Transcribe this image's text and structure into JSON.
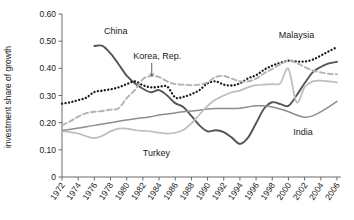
{
  "chart_data": {
    "type": "line",
    "title": "",
    "xlabel": "",
    "ylabel": "investment share of growth",
    "xlim": [
      1972,
      2006.5
    ],
    "ylim": [
      0,
      0.6
    ],
    "grid": false,
    "legend_position": "inline-annotations",
    "xticks": [
      "1972",
      "1974",
      "1976",
      "1978",
      "1980",
      "1982",
      "1984",
      "1986",
      "1988",
      "1990",
      "1992",
      "1994",
      "1996",
      "1998",
      "2000",
      "2002",
      "2004",
      "2006"
    ],
    "yticks": [
      "0",
      "0.10",
      "0.20",
      "0.30",
      "0.40",
      "0.50",
      "0.60"
    ],
    "series": [
      {
        "name": "China",
        "label": "China",
        "style": "solid",
        "color": "#555555",
        "width": 1.9,
        "label_x": 1977.2,
        "label_y": 0.525,
        "x": [
          1976,
          1977,
          1978,
          1979,
          1980,
          1981,
          1982,
          1983,
          1984,
          1985,
          1986,
          1987,
          1988,
          1989,
          1990,
          1991,
          1992,
          1993,
          1994,
          1995,
          1996,
          1997,
          1998,
          1999,
          2000,
          2001,
          2002,
          2003,
          2004,
          2005,
          2006
        ],
        "y": [
          0.482,
          0.483,
          0.455,
          0.415,
          0.373,
          0.345,
          0.325,
          0.312,
          0.32,
          0.3,
          0.272,
          0.258,
          0.225,
          0.19,
          0.168,
          0.172,
          0.165,
          0.145,
          0.122,
          0.145,
          0.198,
          0.252,
          0.275,
          0.268,
          0.262,
          0.3,
          0.345,
          0.385,
          0.405,
          0.418,
          0.424
        ]
      },
      {
        "name": "Malaysia",
        "label": "Malaysia",
        "style": "dotted",
        "color": "#1a1a1a",
        "width": 2.3,
        "label_x": 1998.8,
        "label_y": 0.512,
        "x": [
          1972,
          1973,
          1974,
          1975,
          1976,
          1977,
          1978,
          1979,
          1980,
          1981,
          1982,
          1983,
          1984,
          1985,
          1986,
          1987,
          1988,
          1989,
          1990,
          1991,
          1992,
          1993,
          1994,
          1995,
          1996,
          1997,
          1998,
          1999,
          2000,
          2001,
          2002,
          2003,
          2004,
          2005,
          2006
        ],
        "y": [
          0.27,
          0.275,
          0.283,
          0.292,
          0.313,
          0.318,
          0.323,
          0.33,
          0.342,
          0.352,
          0.338,
          0.33,
          0.332,
          0.333,
          0.293,
          0.295,
          0.305,
          0.32,
          0.345,
          0.352,
          0.34,
          0.337,
          0.345,
          0.363,
          0.375,
          0.395,
          0.41,
          0.42,
          0.428,
          0.425,
          0.425,
          0.432,
          0.447,
          0.463,
          0.478
        ]
      },
      {
        "name": "Korea, Rep.",
        "label": "Korea, Rep.",
        "style": "dashed",
        "color": "#b3b3b3",
        "width": 1.9,
        "label_x": 1980.8,
        "label_y": 0.435,
        "arrow_from_x": 1983.1,
        "arrow_from_y": 0.42,
        "arrow_to_y": 0.372,
        "x": [
          1972,
          1973,
          1974,
          1975,
          1976,
          1977,
          1978,
          1979,
          1980,
          1981,
          1982,
          1983,
          1984,
          1985,
          1986,
          1987,
          1988,
          1989,
          1990,
          1991,
          1992,
          1993,
          1994,
          1995,
          1996,
          1997,
          1998,
          1999,
          2000,
          2001,
          2002,
          2003,
          2004,
          2005,
          2006
        ],
        "y": [
          0.19,
          0.205,
          0.222,
          0.235,
          0.24,
          0.243,
          0.248,
          0.253,
          0.29,
          0.32,
          0.36,
          0.372,
          0.368,
          0.352,
          0.342,
          0.34,
          0.338,
          0.34,
          0.348,
          0.368,
          0.372,
          0.362,
          0.352,
          0.352,
          0.362,
          0.382,
          0.398,
          0.415,
          0.428,
          0.42,
          0.405,
          0.392,
          0.385,
          0.38,
          0.378
        ]
      },
      {
        "name": "India",
        "label": "India",
        "style": "solid",
        "color": "#8c8c8c",
        "width": 1.5,
        "label_x": 2000.6,
        "label_y": 0.155,
        "x": [
          1972,
          1973,
          1974,
          1975,
          1976,
          1977,
          1978,
          1979,
          1980,
          1981,
          1982,
          1983,
          1984,
          1985,
          1986,
          1987,
          1988,
          1989,
          1990,
          1991,
          1992,
          1993,
          1994,
          1995,
          1996,
          1997,
          1998,
          1999,
          2000,
          2001,
          2002,
          2003,
          2004,
          2005,
          2006
        ],
        "y": [
          0.172,
          0.175,
          0.18,
          0.185,
          0.19,
          0.195,
          0.2,
          0.205,
          0.21,
          0.214,
          0.218,
          0.222,
          0.228,
          0.232,
          0.236,
          0.24,
          0.243,
          0.246,
          0.25,
          0.252,
          0.252,
          0.252,
          0.253,
          0.258,
          0.262,
          0.262,
          0.258,
          0.25,
          0.24,
          0.228,
          0.22,
          0.225,
          0.24,
          0.258,
          0.278
        ]
      },
      {
        "name": "Turkey",
        "label": "Turkey",
        "style": "solid",
        "color": "#bdbdbd",
        "width": 1.7,
        "label_x": 1982.0,
        "label_y": 0.078,
        "x": [
          1972,
          1973,
          1974,
          1975,
          1976,
          1977,
          1978,
          1979,
          1980,
          1981,
          1982,
          1983,
          1984,
          1985,
          1986,
          1987,
          1988,
          1989,
          1990,
          1991,
          1992,
          1993,
          1994,
          1995,
          1996,
          1997,
          1998,
          1999,
          2000,
          2001,
          2002,
          2003,
          2004,
          2005,
          2006
        ],
        "y": [
          0.168,
          0.165,
          0.16,
          0.15,
          0.143,
          0.152,
          0.168,
          0.178,
          0.178,
          0.173,
          0.17,
          0.168,
          0.163,
          0.16,
          0.163,
          0.173,
          0.197,
          0.23,
          0.262,
          0.285,
          0.3,
          0.312,
          0.318,
          0.33,
          0.338,
          0.34,
          0.342,
          0.345,
          0.398,
          0.275,
          0.33,
          0.352,
          0.355,
          0.352,
          0.348
        ]
      }
    ]
  }
}
